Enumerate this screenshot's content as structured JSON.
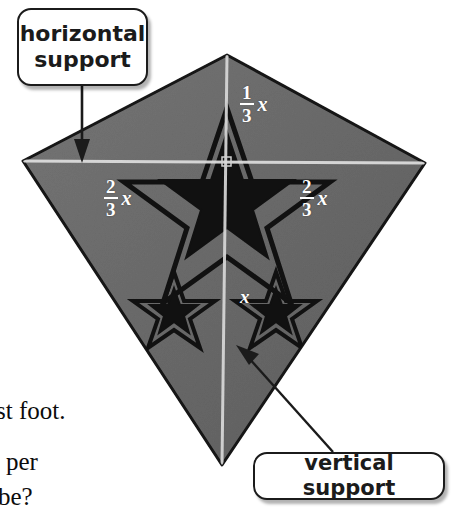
{
  "figure": {
    "type": "kite-diagram",
    "colors": {
      "kite_body": "#6a6a6a",
      "kite_body_light": "#7a7a7a",
      "kite_outline": "#141414",
      "support_line": "#d8d8d8",
      "star_fill": "#111111",
      "callout_border": "#1b1b1b",
      "callout_background": "#ffffff",
      "label_text": "#ffffff",
      "page_text": "#0c0c0c"
    },
    "geometry": {
      "top_vertex": [
        227,
        55
      ],
      "left_vertex": [
        23,
        161
      ],
      "right_vertex": [
        425,
        163
      ],
      "bottom_vertex": [
        222,
        465
      ]
    }
  },
  "callouts": [
    {
      "name": "horizontal-support",
      "line1": "horizontal",
      "line2": "support",
      "points_to": "horizontal support line"
    },
    {
      "name": "vertical-support",
      "label": "vertical support",
      "points_to": "vertical support line"
    }
  ],
  "measurements": [
    {
      "name": "upper-segment",
      "numerator": "1",
      "denominator": "3",
      "variable": "x"
    },
    {
      "name": "left-half-width",
      "numerator": "2",
      "denominator": "3",
      "variable": "x"
    },
    {
      "name": "right-half-width",
      "numerator": "2",
      "denominator": "3",
      "variable": "x"
    },
    {
      "name": "lower-segment",
      "variable": "x"
    }
  ],
  "page_text_fragments": [
    "st foot.",
    "per",
    "be?"
  ]
}
